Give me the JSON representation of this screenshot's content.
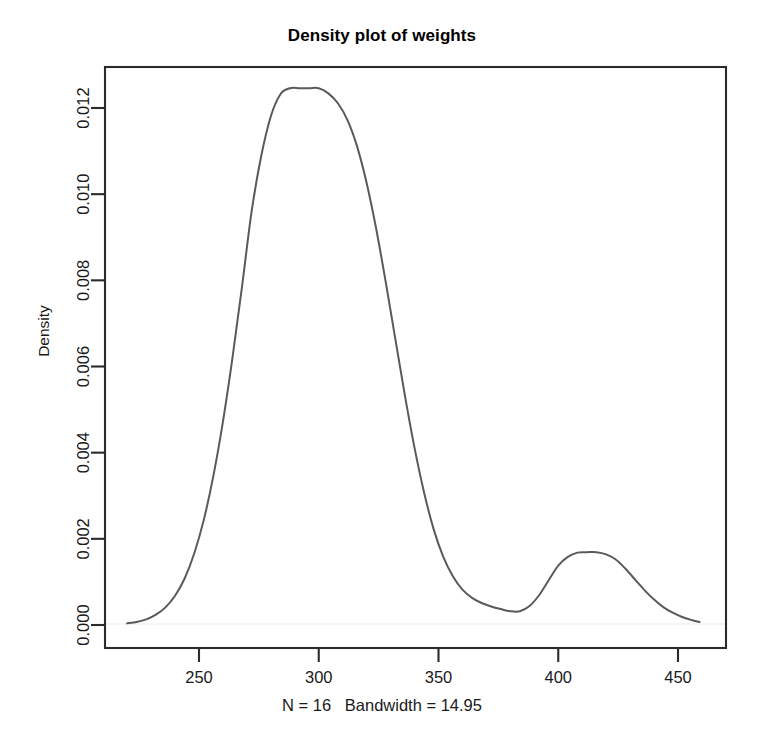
{
  "chart_data": {
    "type": "line",
    "title": "Density plot of weights",
    "xlabel": "N = 16   Bandwidth = 14.95",
    "ylabel": "Density",
    "grid": false,
    "legend": "none",
    "curve_color": "#5a5a5a",
    "baseline_color": "#f2f2f2",
    "axis_color": "#2b2b2b",
    "xlim": [
      218,
      461
    ],
    "ylim": [
      -0.00035,
      0.01332
    ],
    "xticks": [
      250,
      300,
      350,
      400,
      450
    ],
    "xtick_labels": [
      "250",
      "300",
      "350",
      "400",
      "450"
    ],
    "yticks": [
      0.0,
      0.002,
      0.004,
      0.006,
      0.008,
      0.01,
      0.012
    ],
    "ytick_labels": [
      "0.000",
      "0.002",
      "0.004",
      "0.006",
      "0.008",
      "0.010",
      "0.012"
    ],
    "annotations": {
      "primary_peak_x": 300,
      "primary_peak_y": 0.01246,
      "valley_x": 382,
      "valley_y": 0.0003,
      "secondary_peak_x": 415,
      "secondary_peak_y": 0.00169,
      "sample_size": 16,
      "bandwidth": 14.95
    },
    "x": [
      220,
      224,
      228,
      232,
      236,
      240,
      244,
      248,
      252,
      256,
      260,
      264,
      268,
      272,
      276,
      280,
      284,
      288,
      292,
      296,
      300,
      304,
      308,
      312,
      316,
      320,
      324,
      328,
      332,
      336,
      340,
      344,
      348,
      352,
      356,
      360,
      364,
      368,
      372,
      376,
      380,
      384,
      388,
      392,
      396,
      400,
      404,
      408,
      412,
      416,
      420,
      424,
      428,
      432,
      436,
      440,
      444,
      448,
      452,
      456,
      459
    ],
    "y": [
      4e-05,
      7e-05,
      0.00013,
      0.00024,
      0.00041,
      0.00068,
      0.00108,
      0.00166,
      0.00244,
      0.00346,
      0.00472,
      0.00621,
      0.00787,
      0.00961,
      0.01089,
      0.01181,
      0.01232,
      0.01246,
      0.01246,
      0.01246,
      0.01246,
      0.01234,
      0.01211,
      0.01172,
      0.01111,
      0.01026,
      0.00919,
      0.00795,
      0.00663,
      0.00532,
      0.00411,
      0.00307,
      0.00222,
      0.00158,
      0.00113,
      0.00082,
      0.00063,
      0.00051,
      0.00043,
      0.00037,
      0.00032,
      0.00032,
      0.00044,
      0.00069,
      0.00104,
      0.00138,
      0.00158,
      0.00168,
      0.00169,
      0.00169,
      0.00164,
      0.00152,
      0.00131,
      0.00106,
      0.00081,
      0.00059,
      0.00041,
      0.00028,
      0.00018,
      0.00011,
      7e-05
    ]
  }
}
